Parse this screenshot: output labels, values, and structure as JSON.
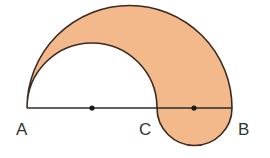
{
  "figure": {
    "points": {
      "A": {
        "label": "A",
        "x": 27,
        "y": 108
      },
      "C": {
        "label": "C",
        "x": 157,
        "y": 108
      },
      "B": {
        "label": "B",
        "x": 232,
        "y": 108
      }
    },
    "midpoints": [
      {
        "x": 92,
        "y": 108
      },
      {
        "x": 194,
        "y": 108
      }
    ],
    "colors": {
      "fill": "#f4b98a",
      "stroke": "#3a2a22",
      "line": "#2b2b2b",
      "label": "#333333"
    }
  }
}
